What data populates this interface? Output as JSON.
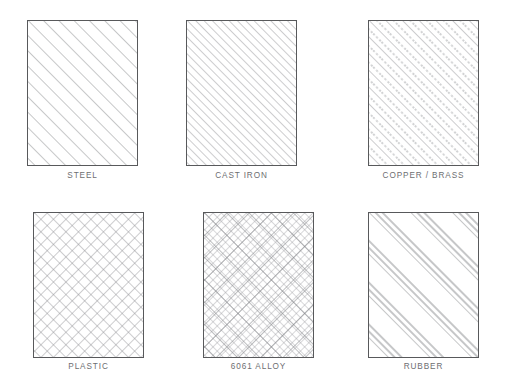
{
  "sheet": {
    "width": 509,
    "height": 392,
    "background": "#ffffff",
    "line_color": "#58595b",
    "hatch_color": "#8d8f92",
    "label_color": "#6d6e71"
  },
  "swatches": [
    {
      "id": "steel",
      "label": "STEEL",
      "pattern": "diagonal-lines-45",
      "pattern_description": "evenly spaced single diagonal lines at 45 degrees rising to the right",
      "spacing_px": 11,
      "x": 27,
      "y": 20,
      "width": 111,
      "height": 146,
      "label_y": 171
    },
    {
      "id": "cast-iron",
      "label": "CAST IRON",
      "pattern": "diagonal-lines-45-fine",
      "pattern_description": "closely spaced single diagonal lines at 45 degrees rising to the right",
      "spacing_px": 6,
      "x": 186,
      "y": 20,
      "width": 111,
      "height": 146,
      "label_y": 171
    },
    {
      "id": "copper-brass",
      "label": "COPPER / BRASS",
      "pattern": "alternating-solid-dashed-diagonal",
      "pattern_description": "diagonal lines at 45 degrees alternating between solid and dashed",
      "spacing_px": 6,
      "x": 368,
      "y": 20,
      "width": 111,
      "height": 146,
      "label_y": 171
    },
    {
      "id": "plastic",
      "label": "PLASTIC",
      "pattern": "cross-hatch",
      "pattern_description": "diagonal cross hatch grid in both directions",
      "spacing_px": 9,
      "x": 33,
      "y": 212,
      "width": 111,
      "height": 146,
      "label_y": 362
    },
    {
      "id": "6061-alloy",
      "label": "6061 ALLOY",
      "pattern": "double-cross-hatch",
      "pattern_description": "fine diagonal cross hatch with a wider spaced cross hatch overlaid",
      "spacing_px": 6,
      "x": 203,
      "y": 212,
      "width": 111,
      "height": 146,
      "label_y": 362
    },
    {
      "id": "rubber",
      "label": "RUBBER",
      "pattern": "grouped-diagonal-lines",
      "pattern_description": "clusters of three closely spaced diagonal lines separated by wide gaps",
      "spacing_px": 30,
      "x": 368,
      "y": 212,
      "width": 111,
      "height": 146,
      "label_y": 362
    }
  ]
}
